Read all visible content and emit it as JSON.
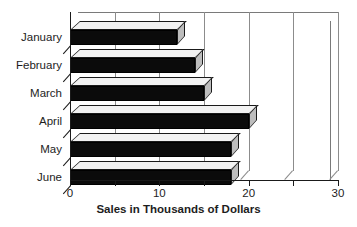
{
  "chart_data": {
    "type": "bar",
    "orientation": "horizontal",
    "style": "3d-bar",
    "title": "",
    "subtitle": "",
    "xlabel": "Sales in Thousands of Dollars",
    "ylabel": "",
    "categories": [
      "January",
      "February",
      "March",
      "April",
      "May",
      "June"
    ],
    "values": [
      12,
      14,
      15,
      20,
      18,
      18
    ],
    "series": [
      {
        "name": "Sales",
        "values": [
          12,
          14,
          15,
          20,
          18,
          18
        ]
      }
    ],
    "xlim": [
      0,
      30
    ],
    "xticks": [
      0,
      5,
      10,
      15,
      20,
      25,
      30
    ],
    "xtick_labels": [
      "0",
      "",
      "10",
      "",
      "20",
      "",
      "30"
    ],
    "grid": true,
    "grid_axis": "x",
    "legend": false,
    "legend_position": "none",
    "colors": {
      "bar_front": "#0b0b0b",
      "bar_top": "#f2f2f2",
      "bar_side": "#bdbdbd",
      "axis": "#1a1a1a",
      "gridline": "#8c8c8c",
      "background": "#ffffff",
      "text": "#1d1d1d"
    }
  },
  "axis": {
    "x_title": "Sales in Thousands of Dollars",
    "tick_labels": [
      {
        "value": 0,
        "text": "0"
      },
      {
        "value": 5,
        "text": ""
      },
      {
        "value": 10,
        "text": "10"
      },
      {
        "value": 15,
        "text": ""
      },
      {
        "value": 20,
        "text": "20"
      },
      {
        "value": 25,
        "text": ""
      },
      {
        "value": 30,
        "text": "30"
      }
    ]
  },
  "categories": [
    {
      "label": "January"
    },
    {
      "label": "February"
    },
    {
      "label": "March"
    },
    {
      "label": "April"
    },
    {
      "label": "May"
    },
    {
      "label": "June"
    }
  ]
}
